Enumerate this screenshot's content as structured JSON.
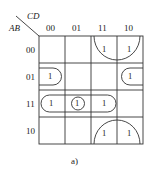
{
  "kmap": {
    "row_var": "AB",
    "col_var": "CD",
    "col_labels": [
      "00",
      "01",
      "11",
      "10"
    ],
    "row_labels": [
      "00",
      "01",
      "11",
      "10"
    ],
    "cells": [
      [
        "",
        "",
        "1",
        "1"
      ],
      [
        "1",
        "",
        "",
        "1"
      ],
      [
        "1",
        "1",
        "1",
        ""
      ],
      [
        "",
        "",
        "1",
        "1"
      ]
    ],
    "groups": [
      {
        "name": "corner-group-top",
        "description": "cells (00,11),(00,10) wrapping with (10,11),(10,10)"
      },
      {
        "name": "row-01-wrap-group",
        "description": "cells (01,00) and (01,10) wrapping horizontally"
      },
      {
        "name": "row-11-group",
        "description": "cells (11,00),(11,01),(11,11)"
      },
      {
        "name": "single-cell-group",
        "description": "cell (11,01)"
      }
    ],
    "caption": "a)"
  }
}
